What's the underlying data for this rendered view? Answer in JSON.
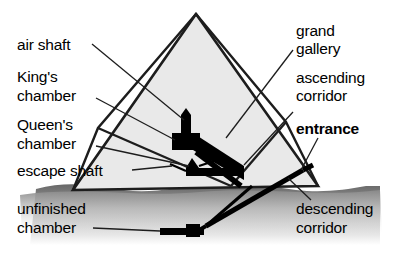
{
  "figure": {
    "background_color": "#ffffff",
    "pyramid_fill": "#e8e8e8",
    "outline_color": "#1a1a1a",
    "ground_color": "#6d6d6d",
    "passage_color": "#000000"
  },
  "labels": {
    "air_shaft": "air shaft",
    "kings_chamber_line1": "King's",
    "kings_chamber_line2": "chamber",
    "queens_chamber_line1": "Queen's",
    "queens_chamber_line2": "chamber",
    "escape_shaft": "escape shaft",
    "unfinished_chamber_line1": "unfinished",
    "unfinished_chamber_line2": "chamber",
    "grand_gallery_line1": "grand",
    "grand_gallery_line2": "gallery",
    "ascending_corridor_line1": "ascending",
    "ascending_corridor_line2": "corridor",
    "entrance": "entrance",
    "descending_corridor_line1": "descending",
    "descending_corridor_line2": "corridor"
  },
  "parts": [
    {
      "id": "air-shaft",
      "label": "air shaft",
      "side": "left"
    },
    {
      "id": "kings-chamber",
      "label": "King's chamber",
      "side": "left"
    },
    {
      "id": "queens-chamber",
      "label": "Queen's chamber",
      "side": "left"
    },
    {
      "id": "escape-shaft",
      "label": "escape shaft",
      "side": "left"
    },
    {
      "id": "unfinished-chamber",
      "label": "unfinished chamber",
      "side": "left"
    },
    {
      "id": "grand-gallery",
      "label": "grand gallery",
      "side": "right"
    },
    {
      "id": "ascending-corridor",
      "label": "ascending corridor",
      "side": "right"
    },
    {
      "id": "entrance",
      "label": "entrance",
      "side": "right",
      "emphasis": "bold"
    },
    {
      "id": "descending-corridor",
      "label": "descending corridor",
      "side": "right"
    }
  ]
}
